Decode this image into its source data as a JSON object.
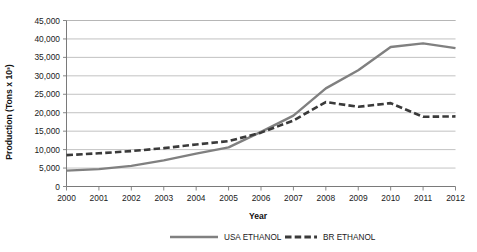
{
  "chart_data": {
    "type": "line",
    "title": "",
    "xlabel": "Year",
    "ylabel": "Production (Tons x 10³)",
    "categories": [
      "2000",
      "2001",
      "2002",
      "2003",
      "2004",
      "2005",
      "2006",
      "2007",
      "2008",
      "2009",
      "2010",
      "2011",
      "2012"
    ],
    "x": [
      2000,
      2001,
      2002,
      2003,
      2004,
      2005,
      2006,
      2007,
      2008,
      2009,
      2010,
      2011,
      2012
    ],
    "ylim": [
      0,
      45000
    ],
    "ytick_labels": [
      "0",
      "5,000",
      "10,000",
      "15,000",
      "20,000",
      "25,000",
      "30,000",
      "35,000",
      "40,000",
      "45,000"
    ],
    "ytick_values": [
      0,
      5000,
      10000,
      15000,
      20000,
      25000,
      30000,
      35000,
      40000,
      45000
    ],
    "grid": true,
    "legend_position": "bottom",
    "series": [
      {
        "name": "USA ETHANOL",
        "style": "solid",
        "color": "#808080",
        "values": [
          4300,
          4700,
          5600,
          7100,
          8900,
          10600,
          14800,
          19200,
          26600,
          31500,
          37800,
          38800,
          37500
        ]
      },
      {
        "name": "BR ETHANOL",
        "style": "dashed",
        "color": "#3a3a3a",
        "values": [
          8500,
          9000,
          9600,
          10400,
          11400,
          12300,
          14600,
          17900,
          22900,
          21600,
          22600,
          18900,
          19000
        ]
      }
    ]
  },
  "legend": {
    "items": [
      {
        "label": "USA ETHANOL"
      },
      {
        "label": "BR ETHANOL"
      }
    ]
  }
}
